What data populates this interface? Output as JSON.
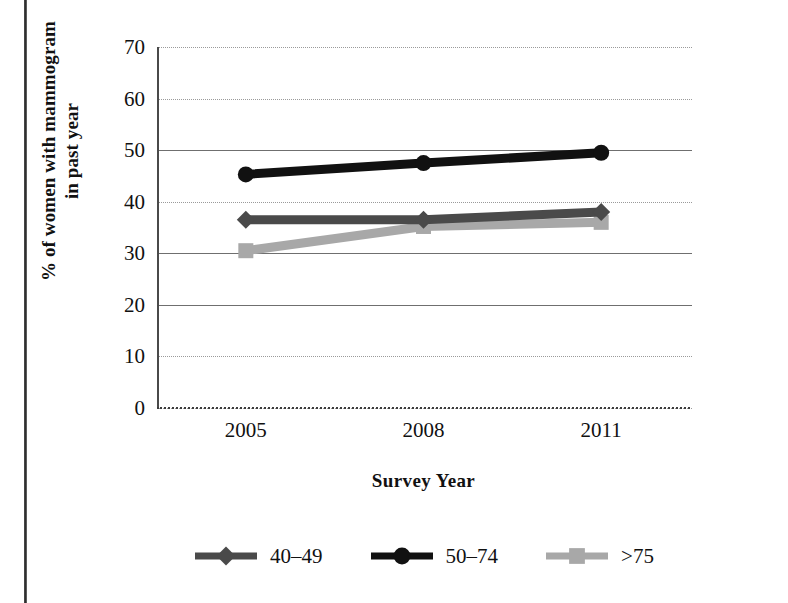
{
  "figure": {
    "y_axis_title_line1": "% of women with mammogram",
    "y_axis_title_line2": "in past year",
    "x_axis_title": "Survey Year"
  },
  "chart_data": {
    "type": "line",
    "title": "",
    "xlabel": "Survey Year",
    "ylabel": "% of women with mammogram in past year",
    "categories": [
      "2005",
      "2008",
      "2011"
    ],
    "x": [
      2005,
      2008,
      2011
    ],
    "ylim": [
      0,
      70
    ],
    "ytick_labels": [
      "0",
      "10",
      "20",
      "30",
      "40",
      "50",
      "60",
      "70"
    ],
    "yticks": [
      0,
      10,
      20,
      30,
      40,
      50,
      60,
      70
    ],
    "grid": "horizontal",
    "gridline_styles": {
      "0": "dotted",
      "10": "dotted",
      "20": "solid",
      "30": "solid",
      "40": "dotted",
      "50": "solid",
      "60": "dotted",
      "70": "dotted"
    },
    "legend_position": "bottom",
    "series": [
      {
        "name": "40-49",
        "label": "40–49",
        "marker": "diamond",
        "color": "#4a4a4a",
        "values": [
          36.5,
          36.5,
          38.0
        ]
      },
      {
        "name": "50-74",
        "label": "50–74",
        "marker": "circle",
        "color": "#111111",
        "values": [
          45.3,
          47.5,
          49.5
        ]
      },
      {
        "name": ">75",
        "label": ">75",
        "marker": "square",
        "color": "#a8a8a8",
        "values": [
          30.5,
          35.2,
          36.0
        ]
      }
    ]
  },
  "legend": {
    "items": [
      {
        "label": "40–49",
        "marker": "diamond",
        "color": "#4a4a4a"
      },
      {
        "label": "50–74",
        "marker": "circle",
        "color": "#111111"
      },
      {
        "label": ">75",
        "marker": "square",
        "color": "#a8a8a8"
      }
    ]
  },
  "colors": {
    "series_40_49": "#4a4a4a",
    "series_50_74": "#111111",
    "series_over_75": "#a8a8a8",
    "gridline_solid": "#6f6f6f",
    "gridline_dotted": "#9a9a9a",
    "axis": "#4a4a4a",
    "text": "#111111",
    "background": "#ffffff"
  }
}
